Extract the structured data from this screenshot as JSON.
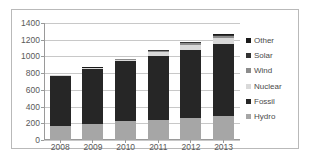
{
  "chart_data": {
    "type": "bar",
    "subtype": "stacked-column",
    "title": "",
    "xlabel": "",
    "ylabel": "",
    "categories": [
      "2008",
      "2009",
      "2010",
      "2011",
      "2012",
      "2013"
    ],
    "ylim": [
      0,
      1400
    ],
    "yticks": [
      0,
      200,
      400,
      600,
      800,
      1000,
      1200,
      1400
    ],
    "grid": true,
    "legend_position": "right",
    "stack_order_bottom_to_top": [
      "Hydro",
      "Fossil",
      "Nuclear",
      "Wind",
      "Solar",
      "Other"
    ],
    "series": [
      {
        "name": "Hydro",
        "color": "#a6a6a6",
        "values": [
          170,
          195,
          222,
          238,
          258,
          288
        ]
      },
      {
        "name": "Fossil",
        "color": "#262626",
        "values": [
          600,
          655,
          718,
          770,
          815,
          860
        ]
      },
      {
        "name": "Nuclear",
        "color": "#d9d9d9",
        "values": [
          8,
          12,
          20,
          46,
          66,
          78
        ]
      },
      {
        "name": "Wind",
        "color": "#8c8c8c",
        "values": [
          2,
          4,
          8,
          14,
          22,
          24
        ]
      },
      {
        "name": "Solar",
        "color": "#333333",
        "values": [
          0,
          2,
          4,
          8,
          10,
          10
        ]
      },
      {
        "name": "Other",
        "color": "#1a1a1a",
        "values": [
          0,
          2,
          3,
          4,
          4,
          5
        ]
      }
    ],
    "totals": [
      780,
      870,
      975,
      1080,
      1175,
      1265
    ],
    "legend_entries_top_to_bottom": [
      "Other",
      "Solar",
      "Wind",
      "Nuclear",
      "Fossil",
      "Hydro"
    ]
  },
  "legend": {
    "items": [
      {
        "label": "Other",
        "color": "#1a1a1a"
      },
      {
        "label": "Solar",
        "color": "#333333"
      },
      {
        "label": "Wind",
        "color": "#8c8c8c"
      },
      {
        "label": "Nuclear",
        "color": "#d9d9d9"
      },
      {
        "label": "Fossil",
        "color": "#262626"
      },
      {
        "label": "Hydro",
        "color": "#a6a6a6"
      }
    ]
  },
  "style": {
    "gridline_color": "#c8c8c8",
    "axis_color": "#9a9a9a",
    "tick_text_color": "#595959",
    "frame_border_color": "#b9b9b9",
    "background": "#ffffff"
  }
}
